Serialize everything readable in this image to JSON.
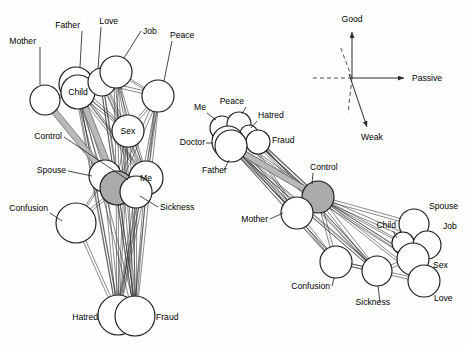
{
  "figure": {
    "background": "#ffffff",
    "node_fill": "#ffffff",
    "node_stroke": "#1a1a1a",
    "highlight_fill": "#aaaaaa",
    "band_fill": "#b9b9b9",
    "edge_color": "#2b2b2b"
  },
  "left_diagram": {
    "name": "left-network-graph",
    "nodes": [
      {
        "id": "mother",
        "label": "Mother",
        "cx": 45,
        "cy": 100,
        "r": 15,
        "highlight": false,
        "label_inside": false,
        "label_x": 36,
        "label_y": 44,
        "anchor": "end",
        "leader": [
          [
            40,
            47
          ],
          [
            40,
            85
          ]
        ]
      },
      {
        "id": "father",
        "label": "Father",
        "cx": 76,
        "cy": 84,
        "r": 17,
        "highlight": false,
        "label_inside": false,
        "label_x": 80,
        "label_y": 28,
        "anchor": "end",
        "leader": [
          [
            82,
            31
          ],
          [
            80,
            67
          ]
        ]
      },
      {
        "id": "child",
        "label": "Child",
        "cx": 78,
        "cy": 92,
        "r": 17,
        "highlight": false,
        "label_inside": true,
        "label_x": 78,
        "label_y": 95,
        "anchor": "middle",
        "leader": []
      },
      {
        "id": "love",
        "label": "Love",
        "cx": 102,
        "cy": 82,
        "r": 14,
        "highlight": false,
        "label_inside": false,
        "label_x": 118,
        "label_y": 24,
        "anchor": "end",
        "leader": [
          [
            101,
            27
          ],
          [
            98,
            69
          ]
        ]
      },
      {
        "id": "job",
        "label": "Job",
        "cx": 116,
        "cy": 72,
        "r": 16,
        "highlight": false,
        "label_inside": false,
        "label_x": 143,
        "label_y": 34,
        "anchor": "start",
        "leader": [
          [
            141,
            31
          ],
          [
            124,
            58
          ]
        ]
      },
      {
        "id": "peace",
        "label": "Peace",
        "cx": 158,
        "cy": 96,
        "r": 16,
        "highlight": false,
        "label_inside": false,
        "label_x": 170,
        "label_y": 38,
        "anchor": "start",
        "leader": [
          [
            172,
            41
          ],
          [
            164,
            81
          ]
        ]
      },
      {
        "id": "sex",
        "label": "Sex",
        "cx": 128,
        "cy": 131,
        "r": 16,
        "highlight": false,
        "label_inside": true,
        "label_x": 128,
        "label_y": 134,
        "anchor": "middle",
        "leader": []
      },
      {
        "id": "spouse",
        "label": "Spouse",
        "cx": 105,
        "cy": 176,
        "r": 16,
        "highlight": false,
        "label_inside": false,
        "label_x": 66,
        "label_y": 173,
        "anchor": "end",
        "leader": [
          [
            68,
            171
          ],
          [
            92,
            176
          ]
        ]
      },
      {
        "id": "control",
        "label": "Control",
        "cx": 117,
        "cy": 188,
        "r": 17,
        "highlight": true,
        "label_inside": false,
        "label_x": 62,
        "label_y": 139,
        "anchor": "end",
        "leader": [
          [
            64,
            137
          ],
          [
            128,
            180
          ]
        ]
      },
      {
        "id": "me",
        "label": "Me",
        "cx": 146,
        "cy": 178,
        "r": 17,
        "highlight": false,
        "label_inside": true,
        "label_x": 146,
        "label_y": 181,
        "anchor": "middle",
        "leader": []
      },
      {
        "id": "sickness",
        "label": "Sickness",
        "cx": 136,
        "cy": 192,
        "r": 16,
        "highlight": false,
        "label_inside": false,
        "label_x": 160,
        "label_y": 210,
        "anchor": "start",
        "leader": [
          [
            158,
            207
          ],
          [
            140,
            196
          ]
        ]
      },
      {
        "id": "confusion",
        "label": "Confusion",
        "cx": 76,
        "cy": 223,
        "r": 20,
        "highlight": false,
        "label_inside": false,
        "label_x": 48,
        "label_y": 211,
        "anchor": "end",
        "leader": [
          [
            50,
            213
          ],
          [
            62,
            221
          ]
        ]
      },
      {
        "id": "hatred",
        "label": "Hatred",
        "cx": 118,
        "cy": 315,
        "r": 20,
        "highlight": false,
        "label_inside": false,
        "label_x": 98,
        "label_y": 320,
        "anchor": "end",
        "leader": []
      },
      {
        "id": "fraud",
        "label": "Fraud",
        "cx": 135,
        "cy": 316,
        "r": 20,
        "highlight": false,
        "label_inside": false,
        "label_x": 156,
        "label_y": 320,
        "anchor": "start",
        "leader": []
      }
    ],
    "edges": [
      [
        "child",
        "control"
      ],
      [
        "child",
        "sex"
      ],
      [
        "child",
        "me"
      ],
      [
        "child",
        "spouse"
      ],
      [
        "father",
        "control"
      ],
      [
        "father",
        "sex"
      ],
      [
        "father",
        "me"
      ],
      [
        "mother",
        "child"
      ],
      [
        "mother",
        "control"
      ],
      [
        "love",
        "sex"
      ],
      [
        "love",
        "me"
      ],
      [
        "love",
        "control"
      ],
      [
        "love",
        "peace"
      ],
      [
        "job",
        "peace"
      ],
      [
        "job",
        "sex"
      ],
      [
        "job",
        "me"
      ],
      [
        "job",
        "control"
      ],
      [
        "peace",
        "control"
      ],
      [
        "peace",
        "me"
      ],
      [
        "peace",
        "sex"
      ],
      [
        "sex",
        "control"
      ],
      [
        "sex",
        "me"
      ],
      [
        "sex",
        "hatred"
      ],
      [
        "sex",
        "fraud"
      ],
      [
        "spouse",
        "control"
      ],
      [
        "spouse",
        "confusion"
      ],
      [
        "control",
        "confusion"
      ],
      [
        "control",
        "hatred"
      ],
      [
        "control",
        "fraud"
      ],
      [
        "me",
        "hatred"
      ],
      [
        "me",
        "fraud"
      ],
      [
        "me",
        "sickness"
      ],
      [
        "confusion",
        "hatred"
      ],
      [
        "sickness",
        "fraud"
      ],
      [
        "sickness",
        "hatred"
      ],
      [
        "child",
        "hatred"
      ],
      [
        "child",
        "fraud"
      ],
      [
        "father",
        "hatred"
      ],
      [
        "job",
        "fraud"
      ],
      [
        "peace",
        "fraud"
      ],
      [
        "peace",
        "hatred"
      ],
      [
        "love",
        "fraud"
      ],
      [
        "spouse",
        "hatred"
      ]
    ],
    "bands": [
      [
        "mother",
        "control"
      ],
      [
        "father",
        "control"
      ]
    ]
  },
  "right_diagram": {
    "name": "right-network-graph",
    "nodes": [
      {
        "id": "me",
        "label": "Me",
        "cx": 222,
        "cy": 128,
        "r": 12,
        "highlight": false,
        "label_inside": false,
        "label_x": 206,
        "label_y": 110,
        "anchor": "end",
        "leader": [
          [
            207,
            113
          ],
          [
            216,
            120
          ]
        ]
      },
      {
        "id": "peace",
        "label": "Peace",
        "cx": 239,
        "cy": 124,
        "r": 12,
        "highlight": false,
        "label_inside": false,
        "label_x": 244,
        "label_y": 104,
        "anchor": "end",
        "leader": [
          [
            246,
            107
          ],
          [
            242,
            114
          ]
        ]
      },
      {
        "id": "hatred",
        "label": "Hatred",
        "cx": 249,
        "cy": 134,
        "r": 9,
        "highlight": false,
        "label_inside": false,
        "label_x": 258,
        "label_y": 118,
        "anchor": "start",
        "leader": [
          [
            257,
            121
          ],
          [
            251,
            128
          ]
        ]
      },
      {
        "id": "fraud",
        "label": "Fraud",
        "cx": 258,
        "cy": 142,
        "r": 12,
        "highlight": false,
        "label_inside": false,
        "label_x": 272,
        "label_y": 143,
        "anchor": "start",
        "leader": []
      },
      {
        "id": "doctor",
        "label": "Doctor",
        "cx": 228,
        "cy": 142,
        "r": 16,
        "highlight": false,
        "label_inside": false,
        "label_x": 205,
        "label_y": 145,
        "anchor": "end",
        "leader": [
          [
            206,
            143
          ],
          [
            213,
            143
          ]
        ]
      },
      {
        "id": "father",
        "label": "Father",
        "cx": 231,
        "cy": 146,
        "r": 16,
        "highlight": false,
        "label_inside": false,
        "label_x": 202,
        "label_y": 173,
        "anchor": "start",
        "leader": [
          [
            224,
            170
          ],
          [
            229,
            160
          ]
        ]
      },
      {
        "id": "control",
        "label": "Control",
        "cx": 318,
        "cy": 197,
        "r": 16,
        "highlight": true,
        "label_inside": false,
        "label_x": 310,
        "label_y": 170,
        "anchor": "start",
        "leader": [
          [
            313,
            173
          ],
          [
            312,
            184
          ]
        ]
      },
      {
        "id": "mother",
        "label": "Mother",
        "cx": 297,
        "cy": 213,
        "r": 16,
        "highlight": false,
        "label_inside": false,
        "label_x": 268,
        "label_y": 222,
        "anchor": "end",
        "leader": [
          [
            270,
            219
          ],
          [
            283,
            213
          ]
        ]
      },
      {
        "id": "confusion",
        "label": "Confusion",
        "cx": 336,
        "cy": 262,
        "r": 16,
        "highlight": false,
        "label_inside": false,
        "label_x": 330,
        "label_y": 289,
        "anchor": "end",
        "leader": [
          [
            332,
            286
          ],
          [
            334,
            278
          ]
        ]
      },
      {
        "id": "sickness",
        "label": "Sickness",
        "cx": 377,
        "cy": 271,
        "r": 15,
        "highlight": false,
        "label_inside": false,
        "label_x": 390,
        "label_y": 305,
        "anchor": "end",
        "leader": [
          [
            380,
            302
          ],
          [
            378,
            286
          ]
        ]
      },
      {
        "id": "spouse",
        "label": "Spouse",
        "cx": 414,
        "cy": 224,
        "r": 15,
        "highlight": false,
        "label_inside": false,
        "label_x": 429,
        "label_y": 209,
        "anchor": "start",
        "leader": []
      },
      {
        "id": "child",
        "label": "Child",
        "cx": 403,
        "cy": 243,
        "r": 11,
        "highlight": false,
        "label_inside": false,
        "label_x": 396,
        "label_y": 228,
        "anchor": "end",
        "leader": [
          [
            393,
            231
          ],
          [
            397,
            238
          ]
        ]
      },
      {
        "id": "job",
        "label": "Job",
        "cx": 427,
        "cy": 245,
        "r": 14,
        "highlight": false,
        "label_inside": false,
        "label_x": 443,
        "label_y": 229,
        "anchor": "start",
        "leader": []
      },
      {
        "id": "sex",
        "label": "Sex",
        "cx": 413,
        "cy": 259,
        "r": 16,
        "highlight": false,
        "label_inside": false,
        "label_x": 433,
        "label_y": 268,
        "anchor": "start",
        "leader": []
      },
      {
        "id": "love",
        "label": "Love",
        "cx": 424,
        "cy": 281,
        "r": 16,
        "highlight": false,
        "label_inside": false,
        "label_x": 434,
        "label_y": 301,
        "anchor": "start",
        "leader": []
      }
    ],
    "edges": [
      [
        "doctor",
        "control"
      ],
      [
        "father",
        "control"
      ],
      [
        "me",
        "control"
      ],
      [
        "peace",
        "control"
      ],
      [
        "hatred",
        "control"
      ],
      [
        "fraud",
        "control"
      ],
      [
        "doctor",
        "mother"
      ],
      [
        "father",
        "mother"
      ],
      [
        "control",
        "mother"
      ],
      [
        "control",
        "confusion"
      ],
      [
        "control",
        "sickness"
      ],
      [
        "control",
        "spouse"
      ],
      [
        "control",
        "child"
      ],
      [
        "control",
        "job"
      ],
      [
        "control",
        "sex"
      ],
      [
        "control",
        "love"
      ],
      [
        "mother",
        "confusion"
      ],
      [
        "confusion",
        "sickness"
      ],
      [
        "sickness",
        "sex"
      ],
      [
        "spouse",
        "child"
      ],
      [
        "spouse",
        "job"
      ],
      [
        "spouse",
        "sex"
      ],
      [
        "child",
        "sex"
      ],
      [
        "job",
        "sex"
      ],
      [
        "sex",
        "love"
      ],
      [
        "doctor",
        "confusion"
      ],
      [
        "father",
        "confusion"
      ],
      [
        "doctor",
        "sickness"
      ],
      [
        "me",
        "mother"
      ],
      [
        "peace",
        "mother"
      ],
      [
        "fraud",
        "sickness"
      ],
      [
        "hatred",
        "sickness"
      ],
      [
        "father",
        "sickness"
      ],
      [
        "doctor",
        "sex"
      ],
      [
        "confusion",
        "love"
      ]
    ],
    "bands": [
      [
        "father",
        "control"
      ]
    ]
  },
  "axis_legend": {
    "name": "axis-legend",
    "origin": {
      "x": 352,
      "y": 78
    },
    "labels": {
      "good": "Good",
      "passive": "Passive",
      "weak": "Weak"
    },
    "good_label_pos": {
      "x": 352,
      "y": 22
    },
    "passive_label_pos": {
      "x": 412,
      "y": 81
    },
    "weak_label_pos": {
      "x": 372,
      "y": 140
    },
    "vertical_arrow": [
      [
        352,
        78
      ],
      [
        352,
        32
      ]
    ],
    "horizontal_arrow": [
      [
        352,
        78
      ],
      [
        404,
        78
      ]
    ],
    "dash_horizontal": [
      [
        313,
        78
      ],
      [
        352,
        78
      ]
    ],
    "dash_vertical": [
      [
        352,
        78
      ],
      [
        348,
        113
      ]
    ],
    "dash_upper": [
      [
        352,
        78
      ],
      [
        340,
        46
      ]
    ],
    "weak_arrow": [
      [
        349,
        74
      ],
      [
        367,
        127
      ]
    ]
  }
}
